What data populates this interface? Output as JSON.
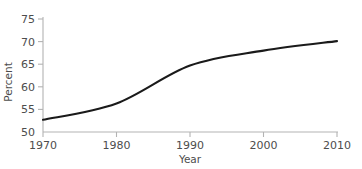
{
  "chart_data": {
    "type": "line",
    "title": "",
    "subtitle": "",
    "xlabel": "Year",
    "ylabel": "Percent",
    "x": [
      1970,
      1980,
      1990,
      2000,
      2010
    ],
    "values": [
      52.7,
      56.3,
      64.7,
      68.0,
      70.1
    ],
    "series": [
      {
        "name": "Percent",
        "x": [
          1970,
          1980,
          1990,
          2000,
          2010
        ],
        "values": [
          52.7,
          56.3,
          64.7,
          68.0,
          70.1
        ]
      }
    ],
    "xlim": [
      1970,
      2010
    ],
    "ylim": [
      50,
      75
    ],
    "xticks": [
      1970,
      1980,
      1990,
      2000,
      2010
    ],
    "yticks": [
      50,
      55,
      60,
      65,
      70,
      75
    ],
    "xticklabels": [
      "1970",
      "1980",
      "1990",
      "2000",
      "2010"
    ],
    "yticklabels": [
      "50",
      "55",
      "60",
      "65",
      "70",
      "75"
    ],
    "grid": false,
    "legend": false,
    "legend_position": "none",
    "annotations": [],
    "line_color": "#1a1a1a",
    "axis_color": "#b3b3b3",
    "tick_label_color": "#4d4d4d",
    "background_color": "#ffffff"
  }
}
